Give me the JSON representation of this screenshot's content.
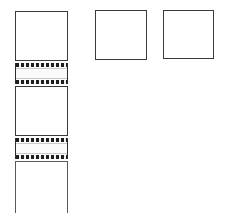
{
  "diagram": {
    "type": "schematic",
    "canvas": {
      "width": 232,
      "height": 213,
      "background": "#ffffff"
    },
    "colors": {
      "outline": "#3a3a3c",
      "outline_light": "#5a5a5e",
      "band_rail": "#1e1e20",
      "band_fill": "#fbfbfb",
      "hairline": "#c9c9cc",
      "background": "#ffffff"
    },
    "shapes": [
      {
        "id": "column-square-top",
        "kind": "square",
        "label": "",
        "x": 15,
        "y": 11,
        "width": 53,
        "height": 50,
        "edges": "all"
      },
      {
        "id": "column-band-upper",
        "kind": "hatched-band",
        "label": "",
        "x": 15,
        "y": 63,
        "width": 53,
        "height": 21,
        "edges": "all"
      },
      {
        "id": "column-square-middle",
        "kind": "square",
        "label": "",
        "x": 15,
        "y": 86,
        "width": 53,
        "height": 50,
        "edges": "all"
      },
      {
        "id": "column-band-lower",
        "kind": "hatched-band",
        "label": "",
        "x": 15,
        "y": 138,
        "width": 53,
        "height": 21,
        "edges": "all"
      },
      {
        "id": "column-square-bottom",
        "kind": "square-open-bottom",
        "label": "",
        "x": 15,
        "y": 161,
        "width": 53,
        "height": 52,
        "edges": "left-right-top"
      },
      {
        "id": "standalone-square-left",
        "kind": "square",
        "label": "",
        "x": 95,
        "y": 10,
        "width": 52,
        "height": 50,
        "edges": "all"
      },
      {
        "id": "standalone-square-right",
        "kind": "square",
        "label": "",
        "x": 163,
        "y": 10,
        "width": 51,
        "height": 49,
        "edges": "all"
      }
    ]
  }
}
